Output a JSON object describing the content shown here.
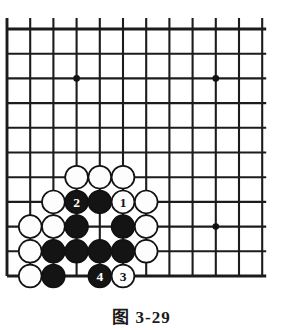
{
  "figure": {
    "caption": "图 3-29",
    "caption_label": "图",
    "chapter": "3",
    "number": "29"
  },
  "board": {
    "type": "go-board-diagram",
    "description": "Partial Go board showing upper-left corner region of a 19x19 goban, bottom edge visible",
    "visible_columns": 12,
    "visible_rows": 11,
    "origin_x": 7,
    "origin_y": 29,
    "col_spacing": 23.2,
    "row_spacing": 24.7,
    "line_color": "#1c1c1c",
    "background_color": "#ffffff",
    "black_color": "#141414",
    "white_color": "#fdfdfd",
    "bottom_edge_row": 10,
    "left_edge_col": 0,
    "star_points": [
      {
        "col": 3,
        "row": 2
      },
      {
        "col": 9,
        "row": 2
      },
      {
        "col": 9,
        "row": 8
      }
    ],
    "stones": [
      {
        "col": 3,
        "row": 6,
        "color": "white",
        "label": ""
      },
      {
        "col": 4,
        "row": 6,
        "color": "white",
        "label": ""
      },
      {
        "col": 5,
        "row": 6,
        "color": "white",
        "label": ""
      },
      {
        "col": 2,
        "row": 7,
        "color": "white",
        "label": ""
      },
      {
        "col": 3,
        "row": 7,
        "color": "black",
        "label": "2"
      },
      {
        "col": 4,
        "row": 7,
        "color": "black",
        "label": ""
      },
      {
        "col": 5,
        "row": 7,
        "color": "white",
        "label": "1"
      },
      {
        "col": 6,
        "row": 7,
        "color": "white",
        "label": ""
      },
      {
        "col": 1,
        "row": 8,
        "color": "white",
        "label": ""
      },
      {
        "col": 2,
        "row": 8,
        "color": "white",
        "label": ""
      },
      {
        "col": 3,
        "row": 8,
        "color": "black",
        "label": ""
      },
      {
        "col": 5,
        "row": 8,
        "color": "black",
        "label": ""
      },
      {
        "col": 6,
        "row": 8,
        "color": "white",
        "label": ""
      },
      {
        "col": 1,
        "row": 9,
        "color": "white",
        "label": ""
      },
      {
        "col": 2,
        "row": 9,
        "color": "black",
        "label": ""
      },
      {
        "col": 3,
        "row": 9,
        "color": "black",
        "label": ""
      },
      {
        "col": 4,
        "row": 9,
        "color": "black",
        "label": ""
      },
      {
        "col": 5,
        "row": 9,
        "color": "black",
        "label": ""
      },
      {
        "col": 6,
        "row": 9,
        "color": "white",
        "label": ""
      },
      {
        "col": 1,
        "row": 10,
        "color": "white",
        "label": ""
      },
      {
        "col": 2,
        "row": 10,
        "color": "black",
        "label": ""
      },
      {
        "col": 4,
        "row": 10,
        "color": "black",
        "label": "4"
      },
      {
        "col": 5,
        "row": 10,
        "color": "white",
        "label": "3"
      }
    ],
    "move_sequence": [
      {
        "number": "1",
        "color": "white",
        "col": 5,
        "row": 7
      },
      {
        "number": "2",
        "color": "black",
        "col": 3,
        "row": 7
      },
      {
        "number": "3",
        "color": "white",
        "col": 5,
        "row": 10
      },
      {
        "number": "4",
        "color": "black",
        "col": 4,
        "row": 10
      }
    ]
  }
}
